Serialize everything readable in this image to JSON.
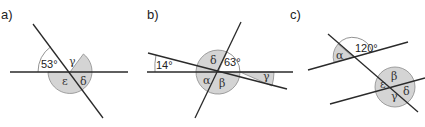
{
  "panels": [
    {
      "label": "a)",
      "given_angle": "53°",
      "unknowns": [
        "γ",
        "ε",
        "δ"
      ]
    },
    {
      "label": "b)",
      "given_angles": [
        "14°",
        "63°"
      ],
      "unknowns": [
        "δ",
        "α",
        "β",
        "γ"
      ]
    },
    {
      "label": "c)",
      "given_angle": "120°",
      "unknowns": [
        "α",
        "ε",
        "β",
        "γ",
        "δ"
      ]
    }
  ],
  "colors": {
    "line": "#2a2a2a",
    "shade": "#d4d4d4",
    "background": "#ffffff"
  }
}
